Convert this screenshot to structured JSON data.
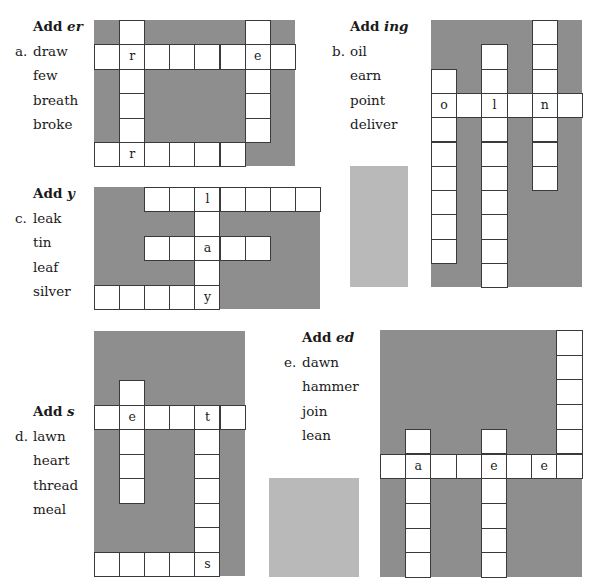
{
  "puzzles": [
    {
      "id": "a",
      "letter": "a.",
      "title_prefix": "Add ",
      "suffix": "er",
      "words": [
        "draw",
        "few",
        "breath",
        "broke"
      ],
      "grid": {
        "x": 94,
        "y": 20,
        "width": 201,
        "height": 146,
        "cell": 25.1,
        "row_h": 24.4,
        "cells": [
          [
            0,
            1,
            ""
          ],
          [
            0,
            6,
            ""
          ],
          [
            1,
            0,
            ""
          ],
          [
            1,
            1,
            "r"
          ],
          [
            1,
            2,
            ""
          ],
          [
            1,
            3,
            ""
          ],
          [
            1,
            4,
            ""
          ],
          [
            1,
            5,
            ""
          ],
          [
            1,
            6,
            "e"
          ],
          [
            1,
            7,
            ""
          ],
          [
            2,
            1,
            ""
          ],
          [
            2,
            6,
            ""
          ],
          [
            3,
            1,
            ""
          ],
          [
            3,
            6,
            ""
          ],
          [
            4,
            1,
            ""
          ],
          [
            4,
            6,
            ""
          ],
          [
            5,
            0,
            ""
          ],
          [
            5,
            1,
            "r"
          ],
          [
            5,
            2,
            ""
          ],
          [
            5,
            3,
            ""
          ],
          [
            5,
            4,
            ""
          ],
          [
            5,
            5,
            ""
          ]
        ]
      },
      "label_pos": {
        "x": 33,
        "y": 14
      }
    },
    {
      "id": "b",
      "letter": "b.",
      "title_prefix": "Add ",
      "suffix": "ing",
      "words": [
        "oil",
        "earn",
        "point",
        "deliver"
      ],
      "grid": {
        "x": 431,
        "y": 20,
        "width": 151,
        "height": 267,
        "cell": 25.2,
        "row_h": 24.3,
        "cells": [
          [
            0,
            4,
            ""
          ],
          [
            1,
            2,
            ""
          ],
          [
            1,
            4,
            ""
          ],
          [
            2,
            0,
            ""
          ],
          [
            2,
            2,
            ""
          ],
          [
            2,
            4,
            ""
          ],
          [
            3,
            0,
            "o"
          ],
          [
            3,
            1,
            ""
          ],
          [
            3,
            2,
            "l"
          ],
          [
            3,
            3,
            ""
          ],
          [
            3,
            4,
            "n"
          ],
          [
            3,
            5,
            ""
          ],
          [
            4,
            0,
            ""
          ],
          [
            4,
            2,
            ""
          ],
          [
            4,
            4,
            ""
          ],
          [
            5,
            0,
            ""
          ],
          [
            5,
            2,
            ""
          ],
          [
            5,
            4,
            ""
          ],
          [
            6,
            0,
            ""
          ],
          [
            6,
            2,
            ""
          ],
          [
            6,
            4,
            ""
          ],
          [
            7,
            0,
            ""
          ],
          [
            7,
            2,
            ""
          ],
          [
            8,
            0,
            ""
          ],
          [
            8,
            2,
            ""
          ],
          [
            9,
            0,
            ""
          ],
          [
            9,
            2,
            ""
          ],
          [
            10,
            2,
            ""
          ]
        ]
      },
      "label_pos": {
        "x": 350,
        "y": 14
      }
    },
    {
      "id": "c",
      "letter": "c.",
      "title_prefix": "Add ",
      "suffix": "y",
      "words": [
        "leak",
        "tin",
        "leaf",
        "silver"
      ],
      "grid": {
        "x": 94,
        "y": 187,
        "width": 226,
        "height": 122,
        "cell": 25.1,
        "row_h": 24.4,
        "cells": [
          [
            0,
            2,
            ""
          ],
          [
            0,
            3,
            ""
          ],
          [
            0,
            4,
            "l"
          ],
          [
            0,
            5,
            ""
          ],
          [
            0,
            6,
            ""
          ],
          [
            0,
            7,
            ""
          ],
          [
            0,
            8,
            ""
          ],
          [
            1,
            4,
            ""
          ],
          [
            2,
            2,
            ""
          ],
          [
            2,
            3,
            ""
          ],
          [
            2,
            4,
            "a"
          ],
          [
            2,
            5,
            ""
          ],
          [
            2,
            6,
            ""
          ],
          [
            3,
            4,
            ""
          ],
          [
            4,
            0,
            ""
          ],
          [
            4,
            1,
            ""
          ],
          [
            4,
            2,
            ""
          ],
          [
            4,
            3,
            ""
          ],
          [
            4,
            4,
            "y"
          ]
        ]
      },
      "label_pos": {
        "x": 33,
        "y": 181
      }
    },
    {
      "id": "d",
      "letter": "d.",
      "title_prefix": "Add ",
      "suffix": "s",
      "words": [
        "lawn",
        "heart",
        "thread",
        "meal"
      ],
      "grid": {
        "x": 94,
        "y": 331,
        "width": 151,
        "height": 245,
        "cell": 25.1,
        "row_h": 24.5,
        "cells": [
          [
            2,
            1,
            ""
          ],
          [
            3,
            0,
            ""
          ],
          [
            3,
            1,
            "e"
          ],
          [
            3,
            2,
            ""
          ],
          [
            3,
            3,
            ""
          ],
          [
            3,
            4,
            "t"
          ],
          [
            3,
            5,
            ""
          ],
          [
            4,
            1,
            ""
          ],
          [
            4,
            4,
            ""
          ],
          [
            5,
            1,
            ""
          ],
          [
            5,
            4,
            ""
          ],
          [
            6,
            1,
            ""
          ],
          [
            6,
            4,
            ""
          ],
          [
            7,
            4,
            ""
          ],
          [
            8,
            4,
            ""
          ],
          [
            9,
            0,
            ""
          ],
          [
            9,
            1,
            ""
          ],
          [
            9,
            2,
            ""
          ],
          [
            9,
            3,
            ""
          ],
          [
            9,
            4,
            "s"
          ]
        ]
      },
      "label_pos": {
        "x": 33,
        "y": 399
      }
    },
    {
      "id": "e",
      "letter": "e.",
      "title_prefix": "Add ",
      "suffix": "ed",
      "words": [
        "dawn",
        "hammer",
        "join",
        "lean"
      ],
      "grid": {
        "x": 380,
        "y": 330,
        "width": 202,
        "height": 247,
        "cell": 25.2,
        "row_h": 24.7,
        "cells": [
          [
            0,
            7,
            ""
          ],
          [
            1,
            7,
            ""
          ],
          [
            2,
            7,
            ""
          ],
          [
            3,
            7,
            ""
          ],
          [
            4,
            1,
            ""
          ],
          [
            4,
            4,
            ""
          ],
          [
            4,
            7,
            ""
          ],
          [
            5,
            0,
            ""
          ],
          [
            5,
            1,
            "a"
          ],
          [
            5,
            2,
            ""
          ],
          [
            5,
            3,
            ""
          ],
          [
            5,
            4,
            "e"
          ],
          [
            5,
            5,
            ""
          ],
          [
            5,
            6,
            "e"
          ],
          [
            5,
            7,
            ""
          ],
          [
            6,
            1,
            ""
          ],
          [
            6,
            4,
            ""
          ],
          [
            7,
            1,
            ""
          ],
          [
            7,
            4,
            ""
          ],
          [
            8,
            1,
            ""
          ],
          [
            8,
            4,
            ""
          ],
          [
            9,
            1,
            ""
          ],
          [
            9,
            4,
            ""
          ]
        ]
      },
      "label_pos": {
        "x": 302,
        "y": 325
      }
    }
  ],
  "swatches": [
    {
      "name": "blank-swatch-upper",
      "x": 350,
      "y": 166,
      "w": 58,
      "h": 121
    },
    {
      "name": "blank-swatch-lower",
      "x": 269,
      "y": 478,
      "w": 90,
      "h": 99
    }
  ],
  "colors": {
    "grid_bg": "#8e8e8e",
    "cell_bg": "#ffffff",
    "swatch": "#b9b9b9"
  }
}
